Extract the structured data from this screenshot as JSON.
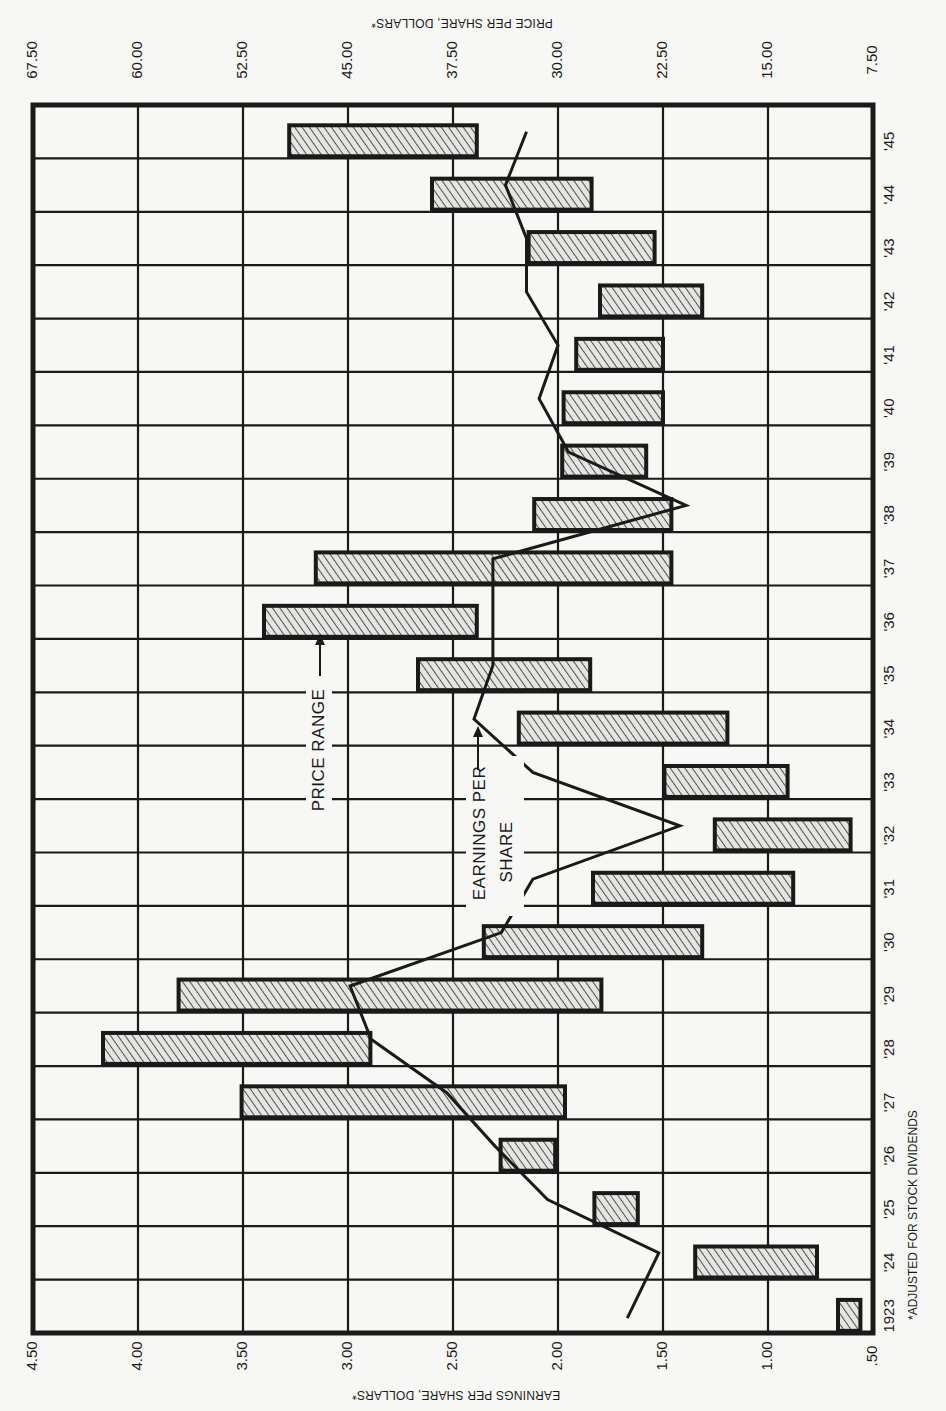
{
  "chart_data": {
    "type": "bar",
    "subtype": "floating-range-bar-with-line",
    "orientation": "rotated-90-ccw",
    "title": "",
    "categories": [
      "1923",
      "'24",
      "'25",
      "'26",
      "'27",
      "'28",
      "'29",
      "'30",
      "'31",
      "'32",
      "'33",
      "'34",
      "'35",
      "'36",
      "'37",
      "'38",
      "'39",
      "'40",
      "'41",
      "'42",
      "'43",
      "'44",
      "'45"
    ],
    "years": [
      1923,
      1924,
      1925,
      1926,
      1927,
      1928,
      1929,
      1930,
      1931,
      1932,
      1933,
      1934,
      1935,
      1936,
      1937,
      1938,
      1939,
      1940,
      1941,
      1942,
      1943,
      1944,
      1945
    ],
    "series": [
      {
        "name": "Price Range",
        "type": "range-bar",
        "axis": "Price per share, dollars*",
        "low": [
          8.4,
          11.5,
          24.3,
          30.2,
          29.5,
          43.4,
          26.9,
          19.7,
          13.2,
          9.1,
          13.6,
          17.9,
          27.7,
          35.8,
          21.9,
          21.9,
          23.7,
          22.5,
          22.5,
          19.7,
          23.1,
          27.6,
          35.8
        ],
        "high": [
          10.0,
          20.2,
          27.4,
          34.1,
          52.6,
          62.5,
          57.1,
          35.3,
          27.5,
          18.8,
          22.4,
          32.8,
          40.0,
          51.0,
          47.3,
          31.7,
          29.7,
          29.6,
          28.7,
          27.0,
          32.1,
          39.0,
          49.2
        ]
      },
      {
        "name": "Earnings Per Share",
        "type": "line",
        "axis": "Earnings per share, dollars*",
        "values": [
          1.67,
          1.52,
          2.05,
          2.3,
          2.53,
          2.89,
          2.99,
          2.27,
          2.12,
          1.42,
          2.12,
          2.4,
          2.31,
          2.31,
          2.31,
          1.39,
          1.95,
          2.09,
          2.0,
          2.15,
          2.15,
          2.25,
          2.15
        ]
      }
    ],
    "value_axis_eps": {
      "label": "Earnings per Share, Dollars*",
      "ticks": [
        "4.50",
        "4.00",
        "3.50",
        "3.00",
        "2.50",
        "2.00",
        "1.50",
        "1.00",
        ".50"
      ],
      "range": [
        0.5,
        4.5
      ]
    },
    "value_axis_price": {
      "label": "Price per Share, Dollars*",
      "ticks": [
        "67.50",
        "60.00",
        "52.50",
        "45.00",
        "37.50",
        "30.00",
        "22.50",
        "15.00",
        "7.50"
      ],
      "range": [
        7.5,
        67.5
      ]
    },
    "xlabel": "Year",
    "grid": true,
    "annotations": [
      "Price Range",
      "Earnings Per Share"
    ],
    "footnote": "*Adjusted for Stock Dividends"
  },
  "labels": {
    "price_axis_title": "PRICE PER SHARE, DOLLARS*",
    "eps_axis_title": "EARNINGS PER SHARE, DOLLARS*",
    "price_range_annotation": "PRICE RANGE",
    "eps_annotation_line1": "EARNINGS PER",
    "eps_annotation_line2": "SHARE",
    "footnote": "*ADJUSTED FOR STOCK DIVIDENDS"
  },
  "colors": {
    "ink": "#1a1a1a",
    "paper": "#f7f7f5",
    "bar_fill": "#d9d9d9",
    "hatch": "#2a2a2a"
  }
}
